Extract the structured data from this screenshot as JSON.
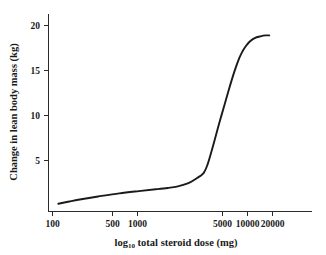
{
  "chart_data": {
    "type": "line",
    "title": "",
    "xlabel": "log10 total steroid dose (mg)",
    "xlabel_main_before": "log",
    "xlabel_subscript": "10",
    "xlabel_main_after": " total steroid dose (mg)",
    "ylabel": "Change in lean body mass (kg)",
    "xscale": "log",
    "yscale": "linear",
    "xlim": [
      100,
      30000
    ],
    "ylim": [
      0,
      21
    ],
    "grid": false,
    "legend": false,
    "line_color": "#1a1a1a",
    "xticks": [
      100,
      500,
      1000,
      5000,
      10000,
      20000
    ],
    "xtick_labels": [
      "100",
      "500",
      "1000",
      "5000",
      "10000",
      "20000"
    ],
    "yticks": [
      5,
      10,
      15,
      20
    ],
    "ytick_labels": [
      "5",
      "10",
      "15",
      "20"
    ],
    "series": [
      {
        "name": "Change in lean body mass",
        "x": [
          115,
          150,
          200,
          300,
          500,
          800,
          1200,
          1600,
          2000,
          2600,
          3200,
          3800,
          4200,
          4600,
          5000,
          5600,
          6300,
          7000,
          8000,
          9000,
          9800,
          10500,
          11500,
          13000,
          15000,
          17000,
          18500
        ],
        "y": [
          0.2,
          0.45,
          0.7,
          1.0,
          1.35,
          1.6,
          1.8,
          1.95,
          2.1,
          2.45,
          3.0,
          3.6,
          4.6,
          6.0,
          7.4,
          9.3,
          11.2,
          12.9,
          14.9,
          16.4,
          17.2,
          17.7,
          18.2,
          18.6,
          18.8,
          18.9,
          18.9
        ]
      }
    ]
  },
  "axis_labels": {
    "y_title": "Change in lean body mass (kg)",
    "x_title_before": "log",
    "x_title_sub": "10",
    "x_title_after": " total steroid dose (mg)"
  }
}
